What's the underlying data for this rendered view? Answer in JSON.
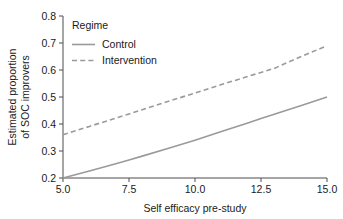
{
  "chart_data": {
    "type": "line",
    "title": "",
    "xlabel": "Self efficacy pre-study",
    "ylabel": "Estimated proportion of SOC improvers",
    "ylabel_line1": "Estimated proportion",
    "ylabel_line2": "of SOC improvers",
    "xlim": [
      5.0,
      15.0
    ],
    "ylim": [
      0.2,
      0.8
    ],
    "xticks": [
      "5.0",
      "7.5",
      "10.0",
      "12.5",
      "15.0"
    ],
    "xtick_values": [
      5.0,
      7.5,
      10.0,
      12.5,
      15.0
    ],
    "yticks": [
      "0.2",
      "0.3",
      "0.4",
      "0.5",
      "0.6",
      "0.7",
      "0.8"
    ],
    "ytick_values": [
      0.2,
      0.3,
      0.4,
      0.5,
      0.6,
      0.7,
      0.8
    ],
    "grid": false,
    "legend_title": "Regime",
    "legend_position": "upper left inside",
    "line_color": "#9a9a9a",
    "axis_color": "#4d4d4d",
    "background": "#ffffff",
    "x": [
      5.0,
      6.0,
      7.0,
      7.5,
      8.0,
      9.0,
      10.0,
      11.0,
      12.0,
      12.5,
      13.0,
      14.0,
      15.0
    ],
    "series": [
      {
        "name": "Control",
        "style": "solid",
        "values": [
          0.2,
          0.226,
          0.253,
          0.267,
          0.281,
          0.31,
          0.34,
          0.372,
          0.404,
          0.42,
          0.436,
          0.468,
          0.5
        ]
      },
      {
        "name": "Intervention",
        "style": "dashed",
        "values": [
          0.36,
          0.391,
          0.422,
          0.437,
          0.453,
          0.484,
          0.515,
          0.546,
          0.576,
          0.591,
          0.606,
          0.649,
          0.69
        ]
      }
    ]
  },
  "legend": {
    "title": "Regime",
    "entries": [
      {
        "label": "Control",
        "style": "solid"
      },
      {
        "label": "Intervention",
        "style": "dashed"
      }
    ]
  },
  "axes": {
    "x_title": "Self efficacy pre-study",
    "y_title_line1": "Estimated proportion",
    "y_title_line2": "of SOC improvers"
  }
}
